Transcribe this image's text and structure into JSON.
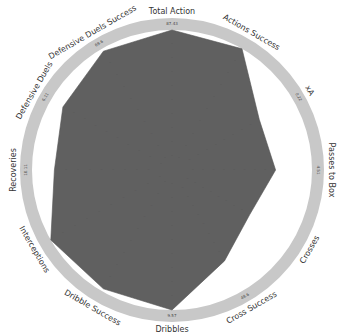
{
  "chart_data": {
    "type": "radar",
    "title": "",
    "categories": [
      "Total Action",
      "Actions Success",
      "xA",
      "Passes to Box",
      "Crosses",
      "Cross Success",
      "Dribbles",
      "Dribble Success",
      "Interceptions",
      "Recoveries",
      "Defensive Duels",
      "Defensive Duels Success"
    ],
    "series": [
      {
        "name": "Player",
        "values": [
          1.0,
          1.0,
          0.72,
          0.74,
          0.64,
          0.75,
          1.0,
          0.98,
          1.0,
          0.84,
          0.9,
          0.98
        ]
      }
    ],
    "max_labels": [
      "87.43",
      "",
      "0.22",
      "4.51",
      "",
      "48.6",
      "9.57",
      "",
      "",
      "10.11",
      "6.11",
      "69.6"
    ],
    "rlim": [
      0,
      1
    ],
    "grid": true,
    "legend": "none",
    "colors": {
      "polygon": "#606060",
      "ring": "#c8c8c8",
      "gap": "#ffffff",
      "text": "#333333"
    }
  }
}
